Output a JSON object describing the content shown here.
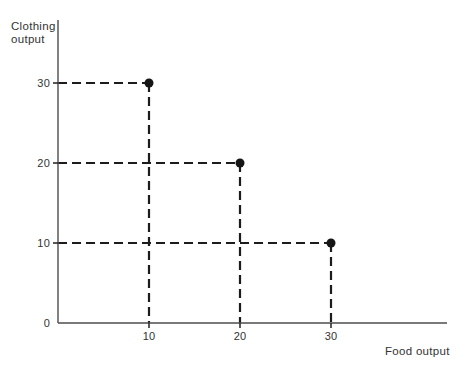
{
  "chart_data": {
    "type": "scatter",
    "xlabel": "Food output",
    "ylabel": "Clothing output",
    "ylabel_lines": [
      "Clothing",
      "output"
    ],
    "points": [
      {
        "x": 10,
        "y": 30
      },
      {
        "x": 20,
        "y": 20
      },
      {
        "x": 30,
        "y": 10
      }
    ],
    "x_ticks": [
      "10",
      "20",
      "30"
    ],
    "y_ticks": [
      "10",
      "20",
      "30"
    ],
    "origin_tick": "0",
    "xlim": [
      0,
      43
    ],
    "ylim": [
      0,
      38
    ],
    "grid": false,
    "guide_style": "dashed",
    "point_style": "filled-circle"
  },
  "colors": {
    "background": "#ffffff",
    "guide_line": "#1c1c1c",
    "axis_line": "#4d4d4d",
    "point_fill": "#151515",
    "text": "#333333"
  }
}
